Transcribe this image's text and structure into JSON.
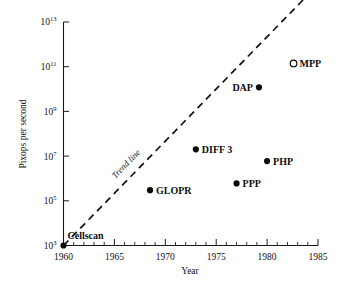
{
  "chart_data": {
    "type": "scatter",
    "title": "",
    "subtitle": "",
    "xlabel": "Year",
    "ylabel": "Pixops per second",
    "xlim": [
      1960,
      1985
    ],
    "ylim": [
      1000,
      10000000000000
    ],
    "y_scale": "log",
    "grid": false,
    "legend": null,
    "x_ticks": [
      "1960",
      "1965",
      "1970",
      "1975",
      "1980",
      "1985"
    ],
    "x_tick_values": [
      1960,
      1965,
      1970,
      1975,
      1980,
      1985
    ],
    "x_minor_tick_step": 1,
    "y_ticks": [
      "10^3",
      "10^5",
      "10^7",
      "10^9",
      "10^11",
      "10^13"
    ],
    "y_tick_mantissa": "10",
    "y_tick_exponents": [
      "3",
      "5",
      "7",
      "9",
      "11",
      "13"
    ],
    "y_tick_values": [
      1000,
      100000,
      10000000,
      1000000000,
      100000000000,
      10000000000000
    ],
    "points": [
      {
        "label": "Cellscan",
        "x": 1960.0,
        "y": 1000,
        "marker": "filled",
        "label_pos": "above-right"
      },
      {
        "label": "GLOPR",
        "x": 1968.5,
        "y": 300000,
        "marker": "filled",
        "label_pos": "right"
      },
      {
        "label": "DIFF 3",
        "x": 1973.0,
        "y": 20000000,
        "marker": "filled",
        "label_pos": "right"
      },
      {
        "label": "PPP",
        "x": 1977.0,
        "y": 600000,
        "marker": "filled",
        "label_pos": "right"
      },
      {
        "label": "DAP",
        "x": 1979.2,
        "y": 12000000000,
        "marker": "filled",
        "label_pos": "left"
      },
      {
        "label": "PHP",
        "x": 1980.0,
        "y": 6000000,
        "marker": "filled",
        "label_pos": "right"
      },
      {
        "label": "MPP",
        "x": 1982.6,
        "y": 140000000000,
        "marker": "open",
        "label_pos": "right"
      }
    ],
    "trend_line": {
      "label": "Trend line",
      "style": "dashed",
      "x_start": 1960.0,
      "y_start": 1000,
      "x_end": 1985.6,
      "y_end": 900000000000000
    }
  },
  "colors": {
    "background": "#ffffff",
    "ink": "#111111",
    "marker_fill": "#0a0a0a",
    "marker_open_fill": "#ffffff"
  }
}
